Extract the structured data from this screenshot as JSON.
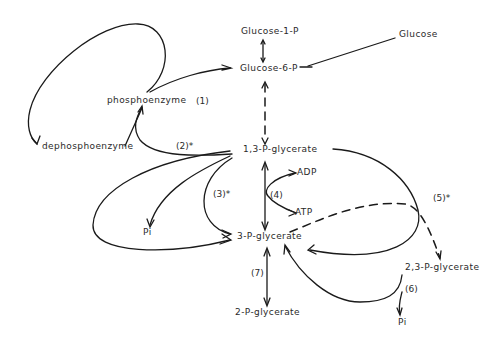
{
  "metabolites": {
    "glucose_1_p": "Glucose-1-P",
    "glucose_6_p": "Glucose-6-P",
    "glucose": "Glucose",
    "phosphoenzyme": "phosphoenzyme",
    "dephosphoenzyme": "dephosphoenzyme",
    "p13_glycerate": "1,3-P-glycerate",
    "adp": "ADP",
    "atp": "ATP",
    "p3_glycerate": "3-P-glycerate",
    "p23_glycerate": "2,3-P-glycerate",
    "p2_glycerate": "2-P-glycerate",
    "pi_left": "Pi",
    "pi_right": "Pi"
  },
  "steps": {
    "s1": "(1)",
    "s2": "(2)*",
    "s3": "(3)*",
    "s4": "(4)",
    "s5": "(5)*",
    "s6": "(6)",
    "s7": "(7)"
  },
  "colors": {
    "ink": "#1a1a1a",
    "background": "#ffffff"
  }
}
